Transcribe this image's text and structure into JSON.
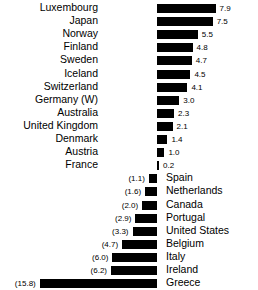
{
  "chart_data": {
    "type": "bar",
    "title": "",
    "subtitle": "",
    "xlabel": "",
    "ylabel": "",
    "orientation": "horizontal",
    "grid": false,
    "legend": null,
    "baseline": 0,
    "note": "Values in parentheses are negative. Positive bars extend right with the country name at left; negative bars extend left with the country name at right.",
    "xlim": [
      -15.8,
      7.9
    ],
    "categories": [
      "Luxembourg",
      "Japan",
      "Norway",
      "Finland",
      "Sweden",
      "Iceland",
      "Switzerland",
      "Germany (W)",
      "Australia",
      "United Kingdom",
      "Denmark",
      "Austria",
      "France",
      "Spain",
      "Netherlands",
      "Canada",
      "Portugal",
      "United States",
      "Belgium",
      "Italy",
      "Ireland",
      "Greece"
    ],
    "values": [
      7.9,
      7.5,
      5.5,
      4.8,
      4.7,
      4.5,
      4.1,
      3.0,
      2.3,
      2.1,
      1.4,
      1.0,
      0.2,
      -1.1,
      -1.6,
      -2.0,
      -2.9,
      -3.3,
      -4.7,
      -6.0,
      -6.2,
      -15.8
    ],
    "tick_labels": [
      "7.9",
      "7.5",
      "5.5",
      "4.8",
      "4.7",
      "4.5",
      "4.1",
      "3.0",
      "2.3",
      "2.1",
      "1.4",
      "1.0",
      "0.2",
      "(1.1)",
      "(1.6)",
      "(2.0)",
      "(2.9)",
      "(3.3)",
      "(4.7)",
      "(6.0)",
      "(6.2)",
      "(15.8)"
    ],
    "colors": {
      "bar": "#000000",
      "background": "#ffffff",
      "text": "#000000"
    }
  }
}
